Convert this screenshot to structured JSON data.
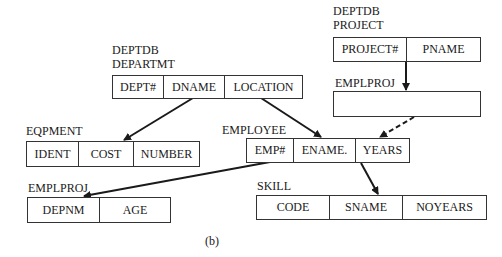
{
  "diagram": {
    "caption": "(b)",
    "records": {
      "departmt": {
        "db_label": "DEPTDB",
        "name": "DEPARTMT",
        "fields": [
          "DEPT#",
          "DNAME",
          "LOCATION"
        ]
      },
      "project": {
        "db_label": "DEPTDB",
        "name": "PROJECT",
        "fields": [
          "PROJECT#",
          "PNAME"
        ]
      },
      "emplproj_top": {
        "name": "EMPLPROJ",
        "fields": []
      },
      "eqpment": {
        "name": "EQPMENT",
        "fields": [
          "IDENT",
          "COST",
          "NUMBER"
        ]
      },
      "employee": {
        "name": "EMPLOYEE",
        "fields": [
          "EMP#",
          "ENAME.",
          "YEARS"
        ]
      },
      "emplproj_bottom": {
        "name": "EMPLPROJ",
        "fields": [
          "DEPNM",
          "AGE"
        ]
      },
      "skill": {
        "name": "SKILL",
        "fields": [
          "CODE",
          "SNAME",
          "NOYEARS"
        ]
      }
    },
    "links": [
      {
        "from": "DEPARTMT.DNAME",
        "to": "EQPMENT.COST",
        "style": "solid"
      },
      {
        "from": "DEPARTMT.LOCATION",
        "to": "EMPLOYEE.ENAME.",
        "style": "solid"
      },
      {
        "from": "PROJECT.PROJECT#",
        "to": "EMPLPROJ",
        "style": "solid"
      },
      {
        "from": "EMPLPROJ",
        "to": "EMPLOYEE.YEARS",
        "style": "dashed"
      },
      {
        "from": "EMPLOYEE.EMP#",
        "to": "EMPLPROJ.DEPNM",
        "style": "solid"
      },
      {
        "from": "EMPLOYEE.YEARS",
        "to": "SKILL.SNAME",
        "style": "solid"
      }
    ],
    "colors": {
      "line": "#1a1a1a",
      "border": "#333333",
      "background": "#ffffff"
    }
  }
}
